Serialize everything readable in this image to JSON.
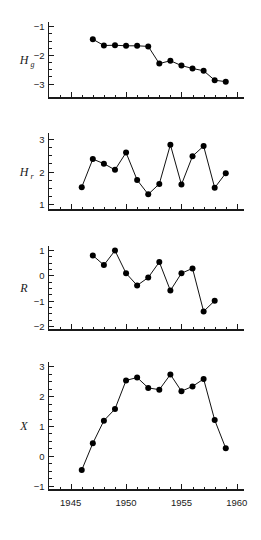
{
  "figure": {
    "title": "",
    "x_axis": {
      "label": "",
      "min": 1943,
      "max": 1960.6,
      "major_ticks": [
        1945,
        1950,
        1955,
        1960
      ],
      "major_tick_labels": [
        "1945",
        "1950",
        "1955",
        "1960"
      ],
      "minor_tick_start": 1944,
      "minor_tick_end": 1959,
      "minor_tick_step": 1
    }
  },
  "chart_data": [
    {
      "type": "line",
      "panel_index": 0,
      "title": "",
      "xlabel": "",
      "ylabel": "Hg",
      "ylabel_base": "H",
      "ylabel_sub": "g",
      "xlim": [
        1943,
        1960.6
      ],
      "ylim": [
        -3.5,
        -0.85
      ],
      "yticks": [
        -1,
        -2,
        -3
      ],
      "ytick_labels": [
        "−1",
        "−2",
        "−3"
      ],
      "yminor_step": 0.25,
      "grid": false,
      "legend": "none",
      "x": [
        1947,
        1948,
        1949,
        1950,
        1951,
        1952,
        1953,
        1954,
        1955,
        1956,
        1957,
        1958,
        1959
      ],
      "values": [
        -1.45,
        -1.67,
        -1.66,
        -1.68,
        -1.68,
        -1.7,
        -2.3,
        -2.2,
        -2.37,
        -2.47,
        -2.55,
        -2.88,
        -2.93
      ]
    },
    {
      "type": "line",
      "panel_index": 1,
      "title": "",
      "xlabel": "",
      "ylabel": "Hr",
      "ylabel_base": "H",
      "ylabel_sub": "r",
      "xlim": [
        1943,
        1960.6
      ],
      "ylim": [
        0.82,
        3.18
      ],
      "yticks": [
        3,
        2,
        1
      ],
      "ytick_labels": [
        "3",
        "2",
        "1"
      ],
      "yminor_step": 0.25,
      "grid": false,
      "legend": "none",
      "x": [
        1946,
        1947,
        1948,
        1949,
        1950,
        1951,
        1952,
        1953,
        1954,
        1955,
        1956,
        1957,
        1958,
        1959
      ],
      "values": [
        1.52,
        2.38,
        2.24,
        2.05,
        2.58,
        1.74,
        1.3,
        1.62,
        2.82,
        1.6,
        2.47,
        2.78,
        1.5,
        1.95
      ]
    },
    {
      "type": "line",
      "panel_index": 2,
      "title": "",
      "xlabel": "",
      "ylabel": "R",
      "ylabel_base": "R",
      "ylabel_sub": "",
      "xlim": [
        1943,
        1960.6
      ],
      "ylim": [
        -2.15,
        1.15
      ],
      "yticks": [
        1,
        0,
        -1,
        -2
      ],
      "ytick_labels": [
        "1",
        "0",
        "−1",
        "−2"
      ],
      "yminor_step": 0.25,
      "grid": false,
      "legend": "none",
      "x": [
        1947,
        1948,
        1949,
        1950,
        1951,
        1952,
        1953,
        1954,
        1955,
        1956,
        1957,
        1958,
        1959
      ],
      "values": [
        0.78,
        0.4,
        0.97,
        0.08,
        -0.4,
        -0.09,
        0.52,
        -0.6,
        0.08,
        0.27,
        -1.42,
        -1.0,
        null
      ]
    },
    {
      "type": "line",
      "panel_index": 3,
      "title": "",
      "xlabel": "",
      "ylabel": "X",
      "ylabel_base": "X",
      "ylabel_sub": "",
      "xlim": [
        1943,
        1960.6
      ],
      "ylim": [
        -1.15,
        3.15
      ],
      "yticks": [
        3,
        2,
        1,
        0,
        -1
      ],
      "ytick_labels": [
        "3",
        "2",
        "1",
        "0",
        "−1"
      ],
      "yminor_step": 0.25,
      "grid": false,
      "legend": "none",
      "x": [
        1946,
        1947,
        1948,
        1949,
        1950,
        1951,
        1952,
        1953,
        1954,
        1955,
        1956,
        1957,
        1958,
        1959
      ],
      "values": [
        -0.48,
        0.42,
        1.18,
        1.57,
        2.53,
        2.63,
        2.28,
        2.22,
        2.73,
        2.17,
        2.33,
        2.58,
        1.2,
        0.25
      ]
    }
  ]
}
